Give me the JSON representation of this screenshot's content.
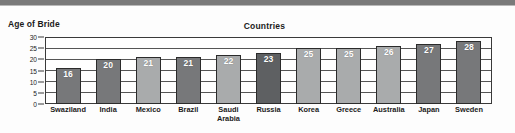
{
  "topbar": {
    "color": "#7a7a7a"
  },
  "labels": {
    "y_axis_title": "Age of Bride",
    "chart_title": "Countries"
  },
  "chart_data": {
    "type": "bar",
    "title": "Countries",
    "xlabel": "Countries",
    "ylabel": "Age of Bride",
    "ylim": [
      0,
      30
    ],
    "yticks": [
      0,
      5,
      10,
      15,
      20,
      25,
      30
    ],
    "grid": true,
    "legend": "none",
    "categories": [
      "Swaziland",
      "India",
      "Mexico",
      "Brazil",
      "Saudi\nArabia",
      "Russia",
      "Korea",
      "Greece",
      "Australia",
      "Japan",
      "Sweden"
    ],
    "values": [
      16,
      20,
      21,
      21,
      22,
      23,
      25,
      25,
      26,
      27,
      28
    ],
    "bar_colors": [
      "#77787a",
      "#77787a",
      "#a9abac",
      "#77787a",
      "#a9abac",
      "#5e6062",
      "#a9abac",
      "#a9abac",
      "#a9abac",
      "#77787a",
      "#77787a"
    ],
    "bar_shades": [
      "dark",
      "dark",
      "light",
      "dark",
      "light",
      "dark",
      "light",
      "light",
      "light",
      "dark",
      "dark"
    ],
    "data_labels": [
      "16",
      "20",
      "21",
      "21",
      "22",
      "23",
      "25",
      "25",
      "26",
      "27",
      "28"
    ]
  }
}
